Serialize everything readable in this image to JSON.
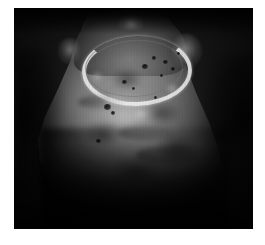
{
  "page": {
    "background_color": "#ffffff",
    "width": 265,
    "height": 245
  },
  "figure": {
    "name": "endoscopic-photograph",
    "caption": "",
    "frame": {
      "x": 14,
      "y": 8,
      "width": 239,
      "height": 221,
      "background_color": "#050505",
      "border_color": "#000000"
    },
    "palette": {
      "field_black": "#050505",
      "shadow": "#1a1a1a",
      "midtone_gray": "#6e6e6e",
      "highlight_gray": "#9a9a9a",
      "bright_band": "#ededed",
      "specimen_edge": "#2a2a2a"
    },
    "elements": {
      "bright_band_label": "bright crescent band",
      "specimen_label": "bell-shaped specimen",
      "neck_label": "upper neck region",
      "illumination_label": "central illuminated surface"
    },
    "surface_marks": [
      {
        "name": "pit-1",
        "x": 128,
        "y": 56,
        "w": 6,
        "h": 5
      },
      {
        "name": "pit-2",
        "x": 138,
        "y": 48,
        "w": 4,
        "h": 4
      },
      {
        "name": "pit-3",
        "x": 149,
        "y": 52,
        "w": 5,
        "h": 4
      },
      {
        "name": "pit-4",
        "x": 157,
        "y": 59,
        "w": 4,
        "h": 4
      },
      {
        "name": "pit-5",
        "x": 146,
        "y": 66,
        "w": 3,
        "h": 3
      },
      {
        "name": "pit-6",
        "x": 108,
        "y": 72,
        "w": 5,
        "h": 4
      },
      {
        "name": "pit-7",
        "x": 118,
        "y": 79,
        "w": 3,
        "h": 3
      },
      {
        "name": "pit-8",
        "x": 90,
        "y": 96,
        "w": 7,
        "h": 6
      },
      {
        "name": "pit-9",
        "x": 97,
        "y": 103,
        "w": 4,
        "h": 4
      },
      {
        "name": "pit-10",
        "x": 82,
        "y": 131,
        "w": 5,
        "h": 4
      },
      {
        "name": "pit-11",
        "x": 140,
        "y": 88,
        "w": 3,
        "h": 3
      },
      {
        "name": "pit-12",
        "x": 163,
        "y": 44,
        "w": 3,
        "h": 3
      }
    ],
    "smudges": [
      {
        "name": "smudge-1",
        "x": 96,
        "y": 60,
        "w": 34,
        "h": 22
      },
      {
        "name": "smudge-2",
        "x": 128,
        "y": 92,
        "w": 40,
        "h": 26
      },
      {
        "name": "smudge-3",
        "x": 70,
        "y": 112,
        "w": 38,
        "h": 28
      },
      {
        "name": "smudge-4",
        "x": 140,
        "y": 124,
        "w": 46,
        "h": 34
      },
      {
        "name": "smudge-5",
        "x": 96,
        "y": 148,
        "w": 52,
        "h": 30
      }
    ],
    "streaks": [
      {
        "name": "streak-1",
        "x": 104,
        "y": 118,
        "w": 56,
        "h": 14
      },
      {
        "name": "streak-2",
        "x": 122,
        "y": 138,
        "w": 64,
        "h": 18
      },
      {
        "name": "streak-3",
        "x": 64,
        "y": 88,
        "w": 40,
        "h": 12
      }
    ],
    "glints": [
      {
        "name": "glint-1",
        "x": 86,
        "y": 84,
        "w": 26,
        "h": 18
      },
      {
        "name": "glint-2",
        "x": 112,
        "y": 96,
        "w": 30,
        "h": 20
      },
      {
        "name": "glint-3",
        "x": 74,
        "y": 62,
        "w": 18,
        "h": 14
      },
      {
        "name": "glint-4",
        "x": 150,
        "y": 74,
        "w": 16,
        "h": 14
      }
    ]
  }
}
